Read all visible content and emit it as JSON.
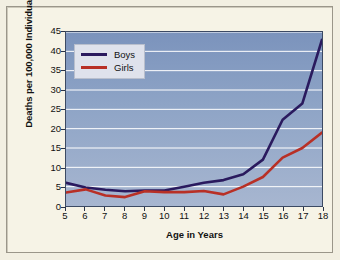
{
  "chart_data": {
    "type": "line",
    "title": "",
    "xlabel": "Age in Years",
    "ylabel": "Deaths per 100,000 Individuals",
    "x": [
      5,
      6,
      7,
      8,
      9,
      10,
      11,
      12,
      13,
      14,
      15,
      16,
      17,
      18
    ],
    "xtick_labels": [
      "5",
      "6",
      "7",
      "8",
      "9",
      "10",
      "11",
      "12",
      "13",
      "14",
      "15",
      "16",
      "17",
      "18"
    ],
    "ytick_labels": [
      "0",
      "5",
      "10",
      "15",
      "20",
      "25",
      "30",
      "35",
      "40",
      "45"
    ],
    "yticks": [
      0,
      5,
      10,
      15,
      20,
      25,
      30,
      35,
      40,
      45
    ],
    "xlim": [
      5,
      18
    ],
    "ylim": [
      0,
      45
    ],
    "grid": "horizontal",
    "legend_position": "upper-left-inside",
    "series": [
      {
        "name": "Boys",
        "color": "#2a1a5e",
        "values": [
          6.0,
          4.8,
          4.2,
          3.8,
          4.0,
          4.0,
          5.0,
          6.0,
          6.7,
          8.2,
          12.0,
          22.3,
          26.5,
          43.0
        ]
      },
      {
        "name": "Girls",
        "color": "#b83026",
        "values": [
          3.5,
          4.3,
          2.7,
          2.3,
          3.8,
          3.6,
          3.6,
          3.9,
          3.0,
          5.0,
          7.5,
          12.5,
          15.0,
          19.0
        ]
      }
    ]
  },
  "legend": {
    "entries": [
      {
        "label": "Boys",
        "color": "#2a1a5e"
      },
      {
        "label": "Girls",
        "color": "#b83026"
      }
    ]
  },
  "colors": {
    "plot_background_top": "#7b93bc",
    "plot_background_bottom": "#a7b6d0",
    "figure_background": "#f6f3e6",
    "gridline": "#ffffff",
    "axis": "#2a3347",
    "boys": "#2a1a5e",
    "girls": "#b83026"
  }
}
